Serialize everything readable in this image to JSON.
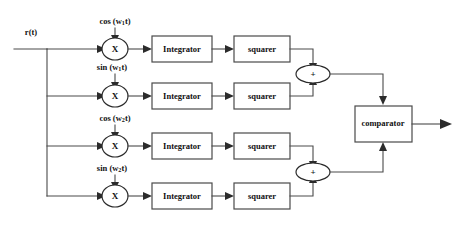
{
  "diagram": {
    "input_signal": "r(t)",
    "stroke_color": "#4a4a4a",
    "text_color": "#111111",
    "background": "#ffffff",
    "carrier_labels": [
      {
        "id": "cos-w1",
        "func": "cos",
        "open": " (w",
        "sub": "1",
        "close": "t)"
      },
      {
        "id": "sin-w1",
        "func": "sin",
        "open": " (w",
        "sub": "1",
        "close": "t)"
      },
      {
        "id": "cos-w2",
        "func": "cos",
        "open": " (w",
        "sub": "2",
        "close": "t)"
      },
      {
        "id": "sin-w2",
        "func": "sin",
        "open": " (w",
        "sub": "2",
        "close": "t)"
      }
    ],
    "multiplier_symbol": "X",
    "adder_symbol": "+",
    "branches": [
      {
        "id": "branch-1",
        "integrator": "Integrator",
        "squarer": "squarer"
      },
      {
        "id": "branch-2",
        "integrator": "Integrator",
        "squarer": "squarer"
      },
      {
        "id": "branch-3",
        "integrator": "Integrator",
        "squarer": "squarer"
      },
      {
        "id": "branch-4",
        "integrator": "Integrator",
        "squarer": "squarer"
      }
    ],
    "comparator_label": "comparator",
    "adders": [
      {
        "id": "adder-upper",
        "symbol": "+"
      },
      {
        "id": "adder-lower",
        "symbol": "+"
      }
    ]
  }
}
